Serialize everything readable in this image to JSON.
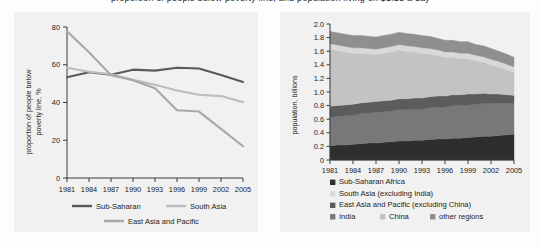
{
  "figure": {
    "cropped_title": "proportion of people below poverty line, and population living on $1.25 a day"
  },
  "left_chart": {
    "name": "poverty-rate-line-chart",
    "ylabel": "proportion of people below\npoverty line, %",
    "ylabel_line1": "proportion of people below",
    "ylabel_line2": "poverty line, %",
    "yticks": [
      "0",
      "20",
      "40",
      "60",
      "80"
    ],
    "xticks": [
      "1981",
      "1984",
      "1987",
      "1990",
      "1993",
      "1996",
      "1999",
      "2002",
      "2005"
    ],
    "legend": [
      {
        "label": "Sub-Saharan",
        "color": "#595959"
      },
      {
        "label": "South Asia",
        "color": "#bdbdbd"
      },
      {
        "label": "East Asia and Pacific",
        "color": "#a8a8a8"
      }
    ]
  },
  "right_chart": {
    "name": "population-stacked-area-chart",
    "ylabel": "population, billions",
    "yticks": [
      "0",
      "0.2",
      "0.4",
      "0.6",
      "0.8",
      "1.0",
      "1.2",
      "1.4",
      "1.6",
      "1.8",
      "2.0"
    ],
    "xticks": [
      "1981",
      "1984",
      "1987",
      "1990",
      "1993",
      "1996",
      "1999",
      "2002",
      "2005"
    ],
    "legend": [
      {
        "label": "Sub-Saharan Africa",
        "color": "#2e2e2e"
      },
      {
        "label": "South Asia (excluding India)",
        "color": "#d8d8d8"
      },
      {
        "label": "East Asia and Pacific (excluding China)",
        "color": "#5c5c5c"
      },
      {
        "label": "India",
        "color": "#787878"
      },
      {
        "label": "China",
        "color": "#c3c3c3"
      },
      {
        "label": "other regions",
        "color": "#8f8f8f"
      }
    ]
  },
  "chart_data": [
    {
      "type": "line",
      "title": "",
      "xlabel": "",
      "ylabel": "proportion of people below poverty line, %",
      "x": [
        1981,
        1984,
        1987,
        1990,
        1993,
        1996,
        1999,
        2002,
        2005
      ],
      "xlim": [
        1981,
        2005
      ],
      "ylim": [
        0,
        80
      ],
      "yticks": [
        0,
        20,
        40,
        60,
        80
      ],
      "grid": false,
      "legend_position": "bottom",
      "series": [
        {
          "name": "Sub-Saharan",
          "color": "#595959",
          "values": [
            53.4,
            56.0,
            54.7,
            57.4,
            56.9,
            58.4,
            58.0,
            54.6,
            50.9
          ]
        },
        {
          "name": "South Asia",
          "color": "#bdbdbd",
          "values": [
            58.4,
            56.3,
            55.0,
            52.0,
            49.4,
            46.4,
            44.1,
            43.4,
            40.2
          ]
        },
        {
          "name": "East Asia and Pacific",
          "color": "#a8a8a8",
          "values": [
            77.7,
            66.6,
            54.5,
            51.8,
            47.6,
            35.9,
            35.2,
            26.0,
            16.8
          ]
        }
      ]
    },
    {
      "type": "area",
      "stacked": true,
      "title": "",
      "xlabel": "",
      "ylabel": "population, billions",
      "x": [
        1981,
        1982,
        1983,
        1984,
        1985,
        1986,
        1987,
        1988,
        1989,
        1990,
        1991,
        1992,
        1993,
        1994,
        1995,
        1996,
        1997,
        1998,
        1999,
        2000,
        2001,
        2002,
        2003,
        2004,
        2005
      ],
      "xlim": [
        1981,
        2005
      ],
      "ylim": [
        0,
        2.0
      ],
      "yticks": [
        0,
        0.2,
        0.4,
        0.6,
        0.8,
        1.0,
        1.2,
        1.4,
        1.6,
        1.8,
        2.0
      ],
      "grid": false,
      "legend_position": "bottom",
      "series": [
        {
          "name": "Sub-Saharan Africa",
          "color": "#2e2e2e",
          "values": [
            0.21,
            0.22,
            0.22,
            0.23,
            0.24,
            0.25,
            0.25,
            0.26,
            0.27,
            0.28,
            0.28,
            0.29,
            0.29,
            0.3,
            0.31,
            0.31,
            0.32,
            0.32,
            0.33,
            0.34,
            0.35,
            0.35,
            0.36,
            0.37,
            0.38
          ]
        },
        {
          "name": "India",
          "color": "#787878",
          "values": [
            0.42,
            0.42,
            0.43,
            0.43,
            0.44,
            0.44,
            0.45,
            0.45,
            0.45,
            0.46,
            0.46,
            0.46,
            0.46,
            0.47,
            0.47,
            0.47,
            0.48,
            0.48,
            0.48,
            0.48,
            0.48,
            0.48,
            0.48,
            0.47,
            0.46
          ]
        },
        {
          "name": "East Asia and Pacific (excluding China)",
          "color": "#5c5c5c",
          "values": [
            0.16,
            0.16,
            0.16,
            0.16,
            0.16,
            0.16,
            0.16,
            0.16,
            0.16,
            0.16,
            0.16,
            0.16,
            0.16,
            0.16,
            0.16,
            0.16,
            0.16,
            0.16,
            0.16,
            0.15,
            0.15,
            0.14,
            0.13,
            0.12,
            0.11
          ]
        },
        {
          "name": "China",
          "color": "#c3c3c3",
          "values": [
            0.84,
            0.81,
            0.78,
            0.75,
            0.73,
            0.71,
            0.69,
            0.7,
            0.71,
            0.72,
            0.7,
            0.68,
            0.66,
            0.63,
            0.6,
            0.57,
            0.55,
            0.53,
            0.52,
            0.49,
            0.46,
            0.43,
            0.4,
            0.37,
            0.34
          ]
        },
        {
          "name": "South Asia (excluding India)",
          "color": "#d8d8d8",
          "values": [
            0.08,
            0.08,
            0.08,
            0.08,
            0.08,
            0.08,
            0.08,
            0.08,
            0.08,
            0.08,
            0.08,
            0.08,
            0.08,
            0.08,
            0.08,
            0.08,
            0.08,
            0.08,
            0.08,
            0.08,
            0.08,
            0.08,
            0.08,
            0.08,
            0.08
          ]
        },
        {
          "name": "other regions",
          "color": "#8f8f8f",
          "values": [
            0.18,
            0.18,
            0.18,
            0.18,
            0.18,
            0.18,
            0.18,
            0.18,
            0.18,
            0.18,
            0.18,
            0.18,
            0.18,
            0.18,
            0.17,
            0.17,
            0.17,
            0.17,
            0.17,
            0.16,
            0.16,
            0.16,
            0.15,
            0.15,
            0.14
          ]
        }
      ]
    }
  ]
}
